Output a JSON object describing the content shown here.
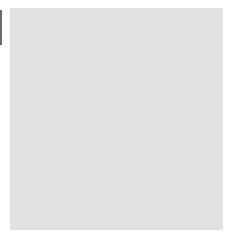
{
  "diagram": {
    "type": "go-board-section",
    "corner": "bottom-left",
    "columns_x": [
      30,
      51,
      71,
      91,
      111,
      131,
      151,
      172,
      192,
      213
    ],
    "rows_y": [
      20,
      41,
      62,
      83,
      104,
      125,
      146,
      167,
      188,
      209
    ],
    "left_edge_col": 0,
    "bottom_edge_row": 9,
    "star_points": [
      {
        "col": 9,
        "row": 0
      },
      {
        "col": 9,
        "row": 6
      }
    ],
    "colors": {
      "board": "#e2e2e2",
      "line": "#555555",
      "black_stone": "#000000",
      "white_stone": "#ffffff"
    },
    "stones": [
      {
        "col": 3,
        "row": 5,
        "color": "white",
        "label": ""
      },
      {
        "col": 4,
        "row": 5,
        "color": "white",
        "label": ""
      },
      {
        "col": 5,
        "row": 5,
        "color": "white",
        "label": ""
      },
      {
        "col": 6,
        "row": 5,
        "color": "white",
        "label": ""
      },
      {
        "col": 2,
        "row": 6,
        "color": "white",
        "label": ""
      },
      {
        "col": 3,
        "row": 6,
        "color": "black",
        "label": ""
      },
      {
        "col": 4,
        "row": 6,
        "color": "black",
        "label": ""
      },
      {
        "col": 5,
        "row": 6,
        "color": "black",
        "label": ""
      },
      {
        "col": 6,
        "row": 6,
        "color": "white",
        "label": ""
      },
      {
        "col": 1,
        "row": 7,
        "color": "white",
        "label": ""
      },
      {
        "col": 3,
        "row": 7,
        "color": "white",
        "label": "2"
      },
      {
        "col": 4,
        "row": 7,
        "color": "white",
        "label": ""
      },
      {
        "col": 5,
        "row": 7,
        "color": "black",
        "label": ""
      },
      {
        "col": 6,
        "row": 7,
        "color": "white",
        "label": ""
      },
      {
        "col": 1,
        "row": 8,
        "color": "white",
        "label": ""
      },
      {
        "col": 2,
        "row": 8,
        "color": "black",
        "label": ""
      },
      {
        "col": 4,
        "row": 8,
        "color": "white",
        "label": ""
      },
      {
        "col": 5,
        "row": 8,
        "color": "black",
        "label": ""
      },
      {
        "col": 6,
        "row": 8,
        "color": "black",
        "label": ""
      },
      {
        "col": 7,
        "row": 8,
        "color": "white",
        "label": ""
      },
      {
        "col": 2,
        "row": 9,
        "color": "white",
        "label": ""
      },
      {
        "col": 3,
        "row": 9,
        "color": "black",
        "label": ""
      },
      {
        "col": 4,
        "row": 9,
        "color": "black",
        "label": "1"
      },
      {
        "col": 5,
        "row": 9,
        "color": "white",
        "label": ""
      },
      {
        "col": 6,
        "row": 9,
        "color": "black",
        "label": ""
      },
      {
        "col": 7,
        "row": 9,
        "color": "white",
        "label": ""
      }
    ]
  }
}
